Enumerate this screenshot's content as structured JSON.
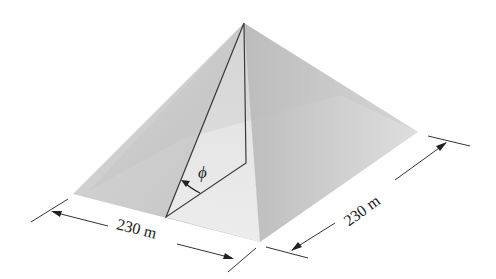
{
  "diagram": {
    "base_side_front": "230 m",
    "base_side_right": "230 m",
    "angle_symbol": "ϕ"
  },
  "colors": {
    "face_left": "#c9c9c9",
    "face_front": "#e6e6e6",
    "face_right": "#d2d2d2",
    "edge": "#4a4a4a",
    "line": "#333333"
  }
}
